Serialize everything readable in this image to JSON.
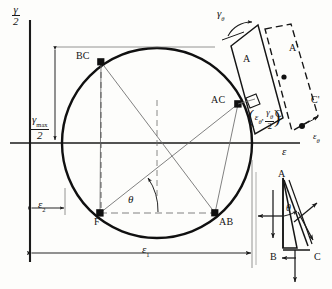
{
  "figure": {
    "type": "mohr-circle-strain-diagram",
    "width": 332,
    "height": 289,
    "background_color": "#fdfdfb",
    "ink_color": "#141414",
    "thin_line_color": "#5a5a5a"
  },
  "axes": {
    "vertical_label_numerator": "γ",
    "vertical_label_denominator": "2",
    "horizontal_label": "ε",
    "vertical_axis_x": 30,
    "horizontal_axis_y": 143
  },
  "circle": {
    "center_x": 157,
    "center_y": 143,
    "radius": 95,
    "left_x": 62,
    "right_x": 252,
    "top_y": 48,
    "bottom_y": 238
  },
  "points": [
    {
      "id": "BC",
      "label": "BC",
      "x": 101,
      "y": 62,
      "label_x": 76,
      "label_y": 54
    },
    {
      "id": "AC",
      "label": "AC",
      "x": 238,
      "y": 104,
      "label_x": 211,
      "label_y": 97
    },
    {
      "id": "F",
      "label": "F",
      "x": 100,
      "y": 213,
      "label_x": 93,
      "label_y": 218
    },
    {
      "id": "AB",
      "label": "AB",
      "x": 215,
      "y": 213,
      "label_x": 219,
      "label_y": 218
    }
  ],
  "dimensions": {
    "gamma_max_numerator": "γ",
    "gamma_max_subscript": "max",
    "gamma_max_denominator": "2",
    "epsilon_2_label": "ε",
    "epsilon_2_subscript": "2",
    "epsilon_1_label": "ε",
    "epsilon_1_subscript": "1"
  },
  "angles": {
    "theta_main": "θ",
    "theta_inset": "θ",
    "gamma_theta_top": "γ",
    "gamma_theta_top_subscript": "θ"
  },
  "coordinate_annotation": {
    "open_paren": "(",
    "close_paren": ")",
    "epsilon_symbol": "ε",
    "epsilon_subscript": "θ",
    "comma": ",",
    "gamma_symbol": "γ",
    "gamma_subscript": "θ",
    "denominator": "2"
  },
  "element_detail": {
    "labels": [
      {
        "id": "A",
        "text": "A",
        "x": 243,
        "y": 59
      },
      {
        "id": "Ap",
        "text": "A'",
        "x": 289,
        "y": 48
      },
      {
        "id": "C",
        "text": "C",
        "x": 275,
        "y": 114
      },
      {
        "id": "Cp",
        "text": "C'",
        "x": 311,
        "y": 100
      },
      {
        "id": "eps_theta",
        "text": "ε",
        "subscript": "θ",
        "x": 313,
        "y": 130
      }
    ]
  },
  "inset": {
    "labels": [
      {
        "id": "A",
        "text": "A",
        "x": 278,
        "y": 181
      },
      {
        "id": "B",
        "text": "B",
        "x": 272,
        "y": 258
      },
      {
        "id": "C",
        "text": "C",
        "x": 314,
        "y": 258
      },
      {
        "id": "theta",
        "text": "θ",
        "x": 288,
        "y": 212
      }
    ]
  }
}
